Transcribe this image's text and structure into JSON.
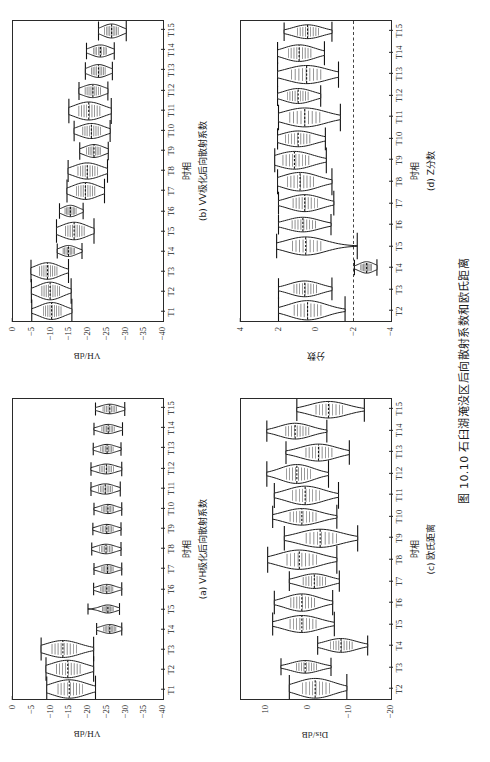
{
  "figure": {
    "caption": "图 10.10  石臼湖淹没区后向散射系数和欧氏距离",
    "axis_x_label": "时相"
  },
  "panels": [
    {
      "key": "a",
      "subcaption": "(a) VH极化后向散射系数",
      "ylabel": "VH/dB",
      "xlabel": "时相",
      "chart_data": {
        "type": "violin",
        "title": "(a) VH极化后向散射系数",
        "xlabel": "时相",
        "ylabel": "VH/dB",
        "ylim": [
          -40,
          0
        ],
        "yticks": [
          0,
          -5,
          -10,
          -15,
          -20,
          -25,
          -30,
          -35,
          -40
        ],
        "grid": false,
        "legend": "none",
        "categories": [
          "T1",
          "T2",
          "T3",
          "T4",
          "T5",
          "T6",
          "T7",
          "T8",
          "T9",
          "T10",
          "T11",
          "T12",
          "T13",
          "T14",
          "T15"
        ],
        "series": [
          {
            "name": "VH backscatter",
            "median": [
              -15.0,
              -14.6,
              -13.3,
              -25.8,
              -25.3,
              -25.0,
              -25.2,
              -24.8,
              -25.0,
              -25.3,
              -24.6,
              -24.9,
              -25.1,
              -25.4,
              -25.8
            ],
            "q_low": [
              -19.0,
              -18.3,
              -17.3,
              -27.6,
              -26.9,
              -26.8,
              -26.9,
              -26.8,
              -26.9,
              -27.0,
              -26.7,
              -27.0,
              -26.9,
              -27.2,
              -27.8
            ],
            "q_high": [
              -11.6,
              -11.2,
              -10.0,
              -24.0,
              -23.7,
              -23.2,
              -23.5,
              -22.9,
              -23.2,
              -23.5,
              -22.6,
              -22.8,
              -23.2,
              -23.5,
              -23.8
            ],
            "whisk_low": [
              -22.0,
              -21.5,
              -21.5,
              -29.0,
              -28.4,
              -29.0,
              -29.0,
              -28.8,
              -28.8,
              -29.0,
              -28.6,
              -29.0,
              -28.8,
              -29.2,
              -29.8
            ],
            "whisk_high": [
              -9.0,
              -8.8,
              -7.5,
              -22.3,
              -20.0,
              -21.5,
              -21.6,
              -21.0,
              -21.3,
              -21.6,
              -20.8,
              -20.8,
              -21.4,
              -21.6,
              -22.0
            ],
            "width": [
              1.0,
              0.95,
              0.92,
              0.48,
              0.44,
              0.5,
              0.48,
              0.52,
              0.5,
              0.5,
              0.56,
              0.54,
              0.5,
              0.5,
              0.52
            ]
          }
        ]
      }
    },
    {
      "key": "b",
      "subcaption": "(b) VV极化后向散射系数",
      "ylabel": "VH/dB",
      "xlabel": "时相",
      "chart_data": {
        "type": "violin",
        "title": "(b) VV极化后向散射系数",
        "xlabel": "时相",
        "ylabel": "VH/dB",
        "ylim": [
          -40,
          0
        ],
        "yticks": [
          0,
          -5,
          -10,
          -15,
          -20,
          -25,
          -30,
          -35,
          -40
        ],
        "grid": false,
        "legend": "none",
        "categories": [
          "T1",
          "T2",
          "T3",
          "T4",
          "T5",
          "T6",
          "T7",
          "T8",
          "T9",
          "T10",
          "T11",
          "T12",
          "T13",
          "T14",
          "T15"
        ],
        "series": [
          {
            "name": "VV backscatter",
            "median": [
              -10.3,
              -9.9,
              -9.2,
              -14.8,
              -16.3,
              -15.3,
              -19.3,
              -19.8,
              -21.6,
              -20.9,
              -20.2,
              -21.3,
              -22.8,
              -23.3,
              -26.3
            ],
            "q_low": [
              -13.1,
              -12.7,
              -12.0,
              -16.6,
              -19.3,
              -17.0,
              -22.1,
              -22.8,
              -23.6,
              -23.6,
              -23.5,
              -23.6,
              -24.8,
              -25.2,
              -28.3
            ],
            "q_high": [
              -7.8,
              -7.4,
              -6.8,
              -13.2,
              -13.7,
              -13.7,
              -16.6,
              -17.0,
              -19.4,
              -18.3,
              -17.2,
              -19.0,
              -20.7,
              -21.2,
              -24.2
            ],
            "whisk_low": [
              -15.7,
              -15.5,
              -14.8,
              -18.4,
              -21.6,
              -18.7,
              -24.4,
              -25.2,
              -25.4,
              -25.9,
              -26.2,
              -25.3,
              -26.5,
              -27.0,
              -30.2
            ],
            "whisk_high": [
              -5.0,
              -4.9,
              -4.8,
              -11.8,
              -11.6,
              -12.4,
              -14.4,
              -14.7,
              -17.8,
              -16.3,
              -14.9,
              -17.6,
              -19.3,
              -19.6,
              -22.8
            ],
            "width": [
              0.92,
              0.96,
              0.9,
              0.6,
              0.95,
              0.62,
              0.92,
              0.88,
              0.7,
              0.82,
              0.98,
              0.72,
              0.7,
              0.66,
              0.76
            ]
          }
        ]
      }
    },
    {
      "key": "c",
      "subcaption": "(c) 欧氏距离",
      "ylabel": "Dis/dB",
      "xlabel": "时相",
      "chart_data": {
        "type": "violin",
        "title": "(c) 欧氏距离",
        "xlabel": "时相",
        "ylabel": "Dis/dB",
        "ylim": [
          -20,
          16
        ],
        "yticks": [
          10,
          0,
          -10,
          -20
        ],
        "grid": false,
        "legend": "none",
        "categories": [
          "T2",
          "T3",
          "T4",
          "T5",
          "T6",
          "T7",
          "T8",
          "T9",
          "T10",
          "T11",
          "T12",
          "T13",
          "T14",
          "T15"
        ],
        "series": [
          {
            "name": "Euclidean distance",
            "median": [
              -1.8,
              0.6,
              -8.0,
              1.4,
              1.4,
              -1.6,
              2.0,
              -3.0,
              1.4,
              0.6,
              2.6,
              -2.6,
              3.0,
              -5.0
            ],
            "q_low": [
              -5.6,
              -2.4,
              -11.0,
              -2.4,
              -2.0,
              -4.6,
              -2.6,
              -7.4,
              -2.4,
              -3.2,
              -1.0,
              -6.2,
              -0.6,
              -8.8
            ],
            "q_high": [
              1.6,
              3.0,
              -5.2,
              4.6,
              4.4,
              1.4,
              5.4,
              0.8,
              4.6,
              4.0,
              5.4,
              0.8,
              5.6,
              -1.6
            ],
            "whisk_low": [
              -9.4,
              -5.6,
              -14.4,
              -6.4,
              -6.0,
              -7.6,
              -7.0,
              -12.0,
              -7.0,
              -7.4,
              -5.0,
              -10.0,
              -4.6,
              -13.6
            ],
            "whisk_high": [
              4.4,
              6.4,
              -2.4,
              8.4,
              8.0,
              4.4,
              9.6,
              5.6,
              8.4,
              8.0,
              9.8,
              5.2,
              9.8,
              2.6
            ],
            "width": [
              1.0,
              0.64,
              0.7,
              0.86,
              0.88,
              0.74,
              0.98,
              0.92,
              0.84,
              0.94,
              0.96,
              0.86,
              0.8,
              0.84
            ]
          }
        ]
      }
    },
    {
      "key": "d",
      "subcaption": "(d) Z分数",
      "ylabel": "分数",
      "xlabel": "时相",
      "reference_line": -2,
      "chart_data": {
        "type": "violin",
        "title": "(d) Z分数",
        "xlabel": "时相",
        "ylabel": "分数",
        "ylim": [
          -4,
          4
        ],
        "yticks": [
          4,
          2,
          0,
          -2,
          -4
        ],
        "grid": false,
        "legend": "none",
        "reference_line_y": -2,
        "categories": [
          "T2",
          "T3",
          "T4",
          "T5",
          "T6",
          "T7",
          "T8",
          "T9",
          "T10",
          "T11",
          "T12",
          "T13",
          "T14",
          "T15"
        ],
        "series": [
          {
            "name": "Z-score",
            "median": [
              0.45,
              0.6,
              -2.7,
              0.55,
              0.7,
              0.6,
              0.85,
              1.15,
              0.95,
              0.6,
              0.95,
              0.5,
              0.9,
              0.45
            ],
            "q_low": [
              -0.35,
              -0.1,
              -3.0,
              -0.35,
              -0.05,
              -0.15,
              0.05,
              0.3,
              0.25,
              -0.3,
              0.35,
              -0.35,
              0.2,
              -0.2
            ],
            "q_high": [
              1.25,
              1.25,
              -2.35,
              1.35,
              1.35,
              1.3,
              1.6,
              1.85,
              1.7,
              1.5,
              1.6,
              1.4,
              1.55,
              1.05
            ],
            "whisk_low": [
              -1.55,
              -0.85,
              -3.25,
              -2.2,
              -0.8,
              -0.95,
              -0.85,
              -0.55,
              -0.5,
              -1.3,
              -0.25,
              -1.2,
              -0.45,
              -0.85
            ],
            "whisk_high": [
              2.0,
              2.0,
              -2.05,
              2.1,
              2.0,
              2.0,
              2.05,
              2.2,
              2.05,
              2.0,
              2.05,
              2.05,
              2.05,
              1.7
            ],
            "width": [
              0.98,
              0.8,
              0.58,
              0.92,
              0.74,
              0.86,
              0.94,
              0.9,
              0.8,
              0.96,
              0.76,
              0.92,
              0.84,
              0.7
            ]
          }
        ]
      }
    }
  ]
}
